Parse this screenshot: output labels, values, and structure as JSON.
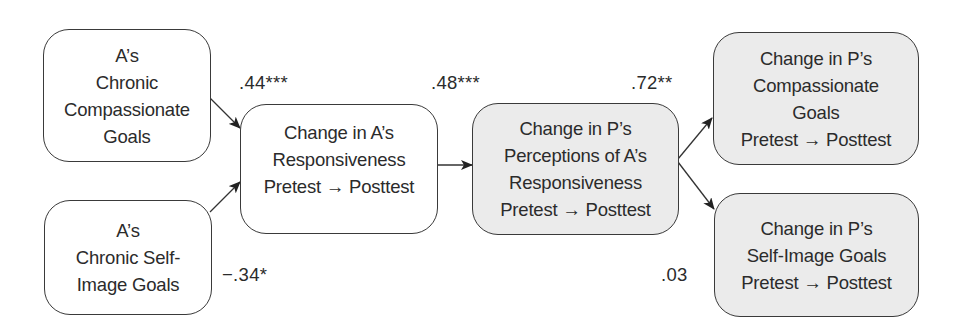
{
  "diagram": {
    "type": "path-model",
    "nodes": [
      {
        "id": "a_compassionate",
        "lines": [
          "A’s",
          "Chronic",
          "Compassionate",
          "Goals"
        ],
        "shaded": false
      },
      {
        "id": "a_self_image",
        "lines": [
          "A’s",
          "Chronic Self-",
          "Image Goals"
        ],
        "shaded": false
      },
      {
        "id": "a_responsiveness",
        "lines": [
          "Change in A’s",
          "Responsiveness",
          "Pretest → Posttest"
        ],
        "shaded": false
      },
      {
        "id": "p_perceptions",
        "lines": [
          "Change in P’s",
          "Perceptions of A’s",
          "Responsiveness",
          "Pretest → Posttest"
        ],
        "shaded": true
      },
      {
        "id": "p_compassionate",
        "lines": [
          "Change in P’s",
          "Compassionate",
          "Goals",
          "Pretest → Posttest"
        ],
        "shaded": true
      },
      {
        "id": "p_self_image",
        "lines": [
          "Change in P’s",
          "Self-Image Goals",
          "Pretest → Posttest"
        ],
        "shaded": true
      }
    ],
    "edges": [
      {
        "from": "a_compassionate",
        "to": "a_responsiveness",
        "coefficient": ".44***"
      },
      {
        "from": "a_self_image",
        "to": "a_responsiveness",
        "coefficient": "−.34*"
      },
      {
        "from": "a_responsiveness",
        "to": "p_perceptions",
        "coefficient": ".48***"
      },
      {
        "from": "p_perceptions",
        "to": "p_compassionate",
        "coefficient": ".72**"
      },
      {
        "from": "p_perceptions",
        "to": "p_self_image",
        "coefficient": ".03"
      }
    ]
  },
  "colors": {
    "stroke": "#3a3a3a",
    "shaded_fill": "#ebebeb",
    "plain_fill": "#ffffff",
    "text": "#2b2b2b"
  }
}
